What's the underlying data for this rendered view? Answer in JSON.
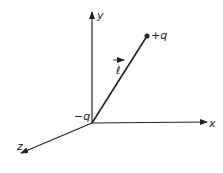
{
  "diagram": {
    "axes": {
      "x_label": "x",
      "y_label": "y",
      "z_label": "z"
    },
    "charges": {
      "negative": "−q",
      "positive": "+q"
    },
    "vector_label": "ℓ",
    "colors": {
      "line": "#222222",
      "background": "#ffffff"
    }
  }
}
